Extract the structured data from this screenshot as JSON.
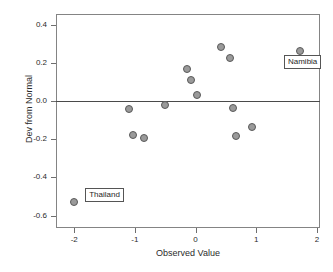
{
  "chart_data": {
    "type": "scatter",
    "title": "",
    "xlabel": "Observed Value",
    "ylabel": "Dev from Normal",
    "xlim": [
      -2.3,
      2.05
    ],
    "ylim": [
      -0.665,
      0.455
    ],
    "grid": false,
    "legend": null,
    "reference_lines": [
      {
        "axis": "y",
        "value": 0.0
      }
    ],
    "xticks": [
      -2,
      -1,
      0,
      1,
      2
    ],
    "xticklabels": [
      "-2",
      "-1",
      "0",
      "1",
      "2"
    ],
    "yticks": [
      0.4,
      0.2,
      0.0,
      -0.2,
      -0.4,
      -0.6
    ],
    "yticklabels": [
      "0.4",
      "0.2",
      "0.0",
      "-0.2",
      "-0.4",
      "-0.6"
    ],
    "marker": {
      "shape": "circle",
      "fill": "#9a9a9a",
      "edge": "#595959",
      "size": 8
    },
    "points": [
      {
        "x": -2.0,
        "y": -0.53,
        "label": "Thailand"
      },
      {
        "x": -1.09,
        "y": -0.04,
        "label": ""
      },
      {
        "x": -1.03,
        "y": -0.18,
        "label": ""
      },
      {
        "x": -0.85,
        "y": -0.192,
        "label": ""
      },
      {
        "x": -0.5,
        "y": -0.022,
        "label": ""
      },
      {
        "x": -0.14,
        "y": 0.168,
        "label": ""
      },
      {
        "x": -0.07,
        "y": 0.11,
        "label": ""
      },
      {
        "x": 0.02,
        "y": 0.031,
        "label": ""
      },
      {
        "x": 0.42,
        "y": 0.28,
        "label": ""
      },
      {
        "x": 0.56,
        "y": 0.224,
        "label": ""
      },
      {
        "x": 0.61,
        "y": -0.035,
        "label": ""
      },
      {
        "x": 0.66,
        "y": -0.183,
        "label": ""
      },
      {
        "x": 0.93,
        "y": -0.138,
        "label": ""
      },
      {
        "x": 1.72,
        "y": 0.259,
        "label": "Namibia"
      }
    ],
    "annotations": [
      {
        "text": "Thailand",
        "point_x": -2.0,
        "point_y": -0.53
      },
      {
        "text": "Namibia",
        "point_x": 1.72,
        "point_y": 0.259
      }
    ]
  }
}
